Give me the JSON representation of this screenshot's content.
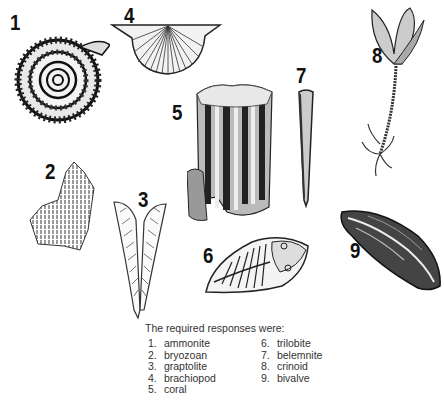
{
  "figures": [
    {
      "number": "1",
      "name": "ammonite-drawing"
    },
    {
      "number": "2",
      "name": "bryozoan-drawing"
    },
    {
      "number": "3",
      "name": "graptolite-drawing"
    },
    {
      "number": "4",
      "name": "brachiopod-drawing"
    },
    {
      "number": "5",
      "name": "coral-drawing"
    },
    {
      "number": "6",
      "name": "trilobite-drawing"
    },
    {
      "number": "7",
      "name": "belemnite-drawing"
    },
    {
      "number": "8",
      "name": "crinoid-drawing"
    },
    {
      "number": "9",
      "name": "bivalve-drawing"
    }
  ],
  "caption": "The required responses were:",
  "responses": [
    {
      "n": "1.",
      "label": "ammonite"
    },
    {
      "n": "2.",
      "label": "bryozoan"
    },
    {
      "n": "3.",
      "label": "graptolite"
    },
    {
      "n": "4.",
      "label": "brachiopod"
    },
    {
      "n": "5.",
      "label": "coral"
    },
    {
      "n": "6.",
      "label": "trilobite"
    },
    {
      "n": "7.",
      "label": "belemnite"
    },
    {
      "n": "8.",
      "label": "crinoid"
    },
    {
      "n": "9.",
      "label": "bivalve"
    }
  ]
}
